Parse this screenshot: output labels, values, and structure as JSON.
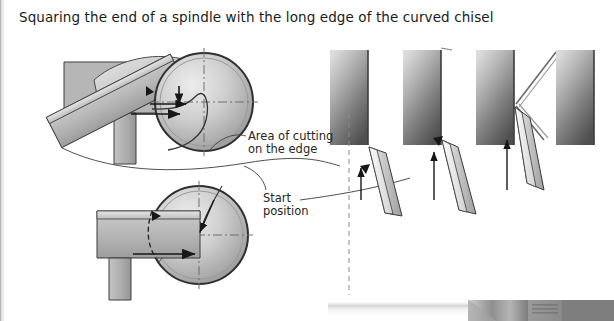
{
  "page": {
    "title": "Squaring the end of a spindle with the long edge of the curved chisel",
    "background_color": "#ffffff",
    "width": 614,
    "height": 321
  },
  "annotations": {
    "area_of_cutting": "Area of cutting\non the edge",
    "start_position": "Start\nposition"
  },
  "left_figures": [
    {
      "name": "upper-view",
      "description": "Chisel presented at an angle to the spindle end, viewed on the tool rest",
      "spindle_circle": {
        "cx": 204,
        "cy": 102,
        "r": 49
      },
      "chisel_angle_deg": -27,
      "tool_rest": true,
      "arrows": 2
    },
    {
      "name": "lower-view",
      "description": "Chisel held flat with the long edge squaring the spindle end",
      "spindle_circle": {
        "cx": 199,
        "cy": 235,
        "r": 49
      },
      "chisel_angle_deg": 0,
      "tool_rest": true,
      "cutting_area_shaded": true,
      "arrows": 2
    }
  ],
  "sequence_panels": [
    {
      "step": 1,
      "name": "panel-start-position",
      "block": {
        "x": 330,
        "y": 50,
        "w": 38,
        "h": 95
      },
      "center_line": "dashed",
      "chisel_angle_deg": 28,
      "up_arrow": true,
      "leader_from_start_position": true
    },
    {
      "step": 2,
      "name": "panel-cut-begins",
      "block": {
        "x": 403,
        "y": 50,
        "w": 38,
        "h": 95
      },
      "center_line": "none",
      "chisel_angle_deg": 24,
      "up_arrow": true,
      "edge_line": true
    },
    {
      "step": 3,
      "name": "panel-chisel-rotated",
      "block": {
        "x": 476,
        "y": 50,
        "w": 38,
        "h": 95
      },
      "center_line": "none",
      "chisel_angle_deg": 18,
      "up_arrow": true,
      "pivot_lines": true
    },
    {
      "step": 4,
      "name": "panel-finished-end",
      "block": {
        "x": 556,
        "y": 50,
        "w": 38,
        "h": 95
      },
      "center_line": "none",
      "chisel_angle_deg": null,
      "up_arrow": false
    }
  ],
  "colors": {
    "ink": "#1b1b1b",
    "outline": "#3a3a3a",
    "steel_light": "#d6d6d6",
    "steel_mid": "#a8a8a8",
    "steel_dark": "#6e6e6e",
    "block_top": "#d8d8d8",
    "block_bottom": "#545454",
    "dash": "#8a8a8a"
  },
  "photo_strip": {
    "name": "workshop-photo-strip",
    "present": true,
    "x": 320,
    "y": 295,
    "width": 294,
    "height": 26
  }
}
